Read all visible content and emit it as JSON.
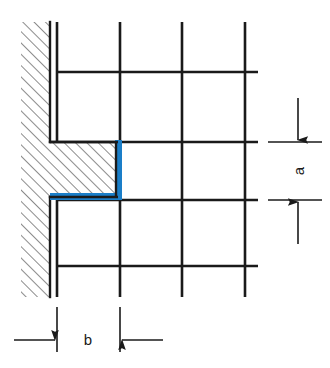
{
  "figure": {
    "kind": "technical-drawing",
    "background_color": "#ffffff",
    "line_color": "#1a1a1a",
    "highlight_color": "#1a7ec8",
    "hatch_color": "#2b2b2b"
  },
  "labels": {
    "dimension_a": "a",
    "dimension_b": "b"
  },
  "annotations": {
    "vertical_dimension": {
      "name": "a",
      "label": "a",
      "orientation": "vertical",
      "arrow_direction": "outward",
      "extension_line_top_y": 142,
      "extension_line_bottom_y": 200,
      "extension_line_x1": 268,
      "extension_line_x2": 322,
      "label_rotation_deg": -90
    },
    "horizontal_dimension": {
      "name": "b",
      "label": "b",
      "orientation": "horizontal",
      "arrow_direction": "inward",
      "extension_line_left_x": 57,
      "extension_line_right_x": 120,
      "extension_line_y1": 307,
      "extension_line_y2": 352,
      "label_rotation_deg": 0
    }
  },
  "geometry": {
    "wall": {
      "hatch_left_x": 21,
      "hatch_right_x": 50,
      "hatch_top_y": 22,
      "hatch_bottom_y": 297,
      "face_line_x": 50,
      "hatch_angle_deg": 45,
      "hatch_spacing_px": 8
    },
    "step": {
      "inner_corner_x": 116,
      "inner_corner_top_y": 142,
      "inner_corner_bottom_y": 200,
      "ledge_left_x": 50,
      "ledge_right_x": 122
    },
    "grid": {
      "vertical_line_x": [
        57,
        120,
        182,
        245
      ],
      "horizontal_line_y": [
        72,
        142,
        200,
        266
      ],
      "grid_top_y": 22,
      "grid_bottom_y": 297,
      "grid_left_x": 50,
      "grid_right_x": 258
    },
    "highlight": {
      "vertical_segment": {
        "x": 116,
        "y_top": 140,
        "y_bottom": 200,
        "thickness": 6
      },
      "horizontal_segment": {
        "y": 194,
        "x_left": 50,
        "x_right": 122,
        "thickness": 6
      }
    }
  }
}
